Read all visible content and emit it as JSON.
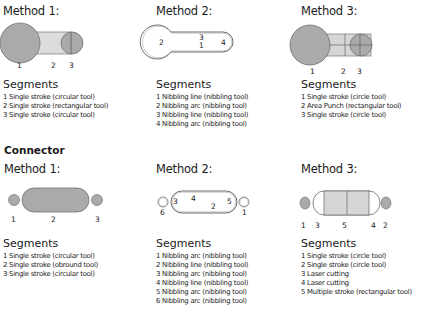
{
  "top": {
    "methods": [
      {
        "title": "Method 1:",
        "labels": [
          "1",
          "2",
          "3"
        ],
        "segments_title": "Segments",
        "segments": [
          "1 Single stroke (circular tool)",
          "2 Single stroke (rectangular tool)",
          "3 Single stroke (circular tool)"
        ]
      },
      {
        "title": "Method 2:",
        "labels": [
          "2",
          "3",
          "1",
          "4"
        ],
        "segments_title": "Segments",
        "segments": [
          "1 Nibbling line (nibbling tool)",
          "2 Nibbling arc (nibbling tool)",
          "3 Nibbling line (nibbling tool)",
          "4 Nibbling arc (nibbling tool)"
        ]
      },
      {
        "title": "Method 3:",
        "labels": [
          "1",
          "2",
          "3"
        ],
        "segments_title": "Segments",
        "segments": [
          "1 Single stroke (circle tool)",
          "2 Area Punch (rectangular tool)",
          "3 Single stroke (circle tool)"
        ]
      }
    ]
  },
  "connector": {
    "title": "Connector",
    "methods": [
      {
        "title": "Method 1:",
        "labels": [
          "1",
          "2",
          "3"
        ],
        "segments_title": "Segments",
        "segments": [
          "1 Single stroke (circular tool)",
          "2 Single stroke (obround tool)",
          "3 Single stroke (circular tool)"
        ]
      },
      {
        "title": "Method 2:",
        "labels": [
          "3",
          "4",
          "2",
          "5",
          "6",
          "1"
        ],
        "segments_title": "Segments",
        "segments": [
          "1 Nibbling arc (nibbling tool)",
          "2 Nibbling line (nibbling tool)",
          "3 Nibbling arc (nibbling tool)",
          "4 Nibbling line (nibbling tool)",
          "5 Nibbling arc (nibbling tool)",
          "6 Nibbling arc (nibbling tool)"
        ]
      },
      {
        "title": "Method 3:",
        "labels": [
          "1",
          "3",
          "5",
          "4",
          "2"
        ],
        "segments_title": "Segments",
        "segments": [
          "1 Single stroke (circle tool)",
          "2 Single stroke (circle tool)",
          "3 Laser cutting",
          "4 Laser cutting",
          "5 Multiple stroke (rectangular tool)"
        ]
      }
    ]
  },
  "colors": {
    "fill_dark": "#a9a9a9",
    "fill_light": "#d6d6d6",
    "stroke": "#555555",
    "text": "#1a1a1a"
  }
}
